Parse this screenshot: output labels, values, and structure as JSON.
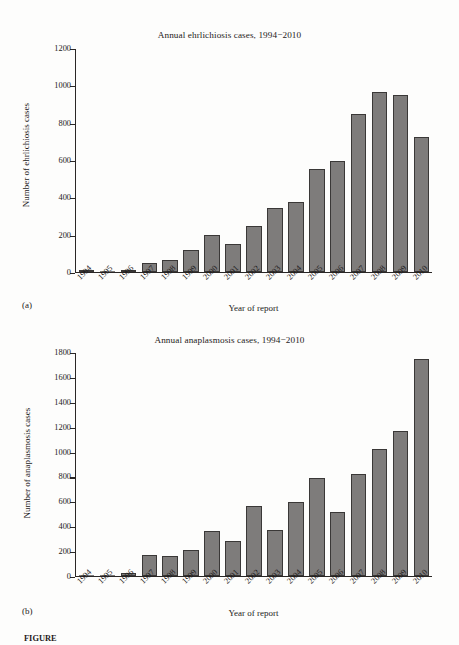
{
  "figure": {
    "panel_a_label": "(a)",
    "panel_b_label": "(b)",
    "caption_prefix": "FIGURE"
  },
  "chart_data": [
    {
      "type": "bar",
      "panel": "(a)",
      "title": "Annual ehrlichiosis cases, 1994−2010",
      "xlabel": "Year of report",
      "ylabel": "Number of ehrlichiosis cases",
      "categories": [
        "1994",
        "1995",
        "1996",
        "1997",
        "1998",
        "1999",
        "2000",
        "2001",
        "2002",
        "2003",
        "2004",
        "2005",
        "2006",
        "2007",
        "2008",
        "2009",
        "2010"
      ],
      "values": [
        8,
        0,
        8,
        50,
        65,
        120,
        200,
        150,
        245,
        345,
        375,
        555,
        600,
        850,
        970,
        950,
        725
      ],
      "ylim": [
        0,
        1200
      ],
      "yticks": [
        0,
        200,
        400,
        600,
        800,
        1000,
        1200
      ],
      "ytick_labels": [
        "0",
        "200",
        "400",
        "600",
        "800",
        "1000",
        "1200"
      ],
      "grid": false,
      "legend": "none",
      "bar_color": "#7e7c7b",
      "bar_edge_color": "#3a3837"
    },
    {
      "type": "bar",
      "panel": "(b)",
      "title": "Annual anaplasmosis cases, 1994−2010",
      "xlabel": "Year of report",
      "ylabel": "Number of anaplasmosis cases",
      "categories": [
        "1994",
        "1995",
        "1996",
        "1997",
        "1998",
        "1999",
        "2000",
        "2001",
        "2002",
        "2003",
        "2004",
        "2005",
        "2006",
        "2007",
        "2008",
        "2009",
        "2010"
      ],
      "values": [
        0,
        0,
        25,
        170,
        160,
        210,
        365,
        285,
        565,
        370,
        595,
        795,
        515,
        825,
        1025,
        1170,
        1755
      ],
      "ylim": [
        0,
        1800
      ],
      "yticks": [
        0,
        200,
        400,
        600,
        800,
        1000,
        1200,
        1400,
        1600,
        1800
      ],
      "ytick_labels": [
        "0",
        "200",
        "400",
        "600",
        "800",
        "1000",
        "1200",
        "1400",
        "1600",
        "1800"
      ],
      "grid": false,
      "legend": "none",
      "bar_color": "#7e7c7b",
      "bar_edge_color": "#3a3837"
    }
  ]
}
